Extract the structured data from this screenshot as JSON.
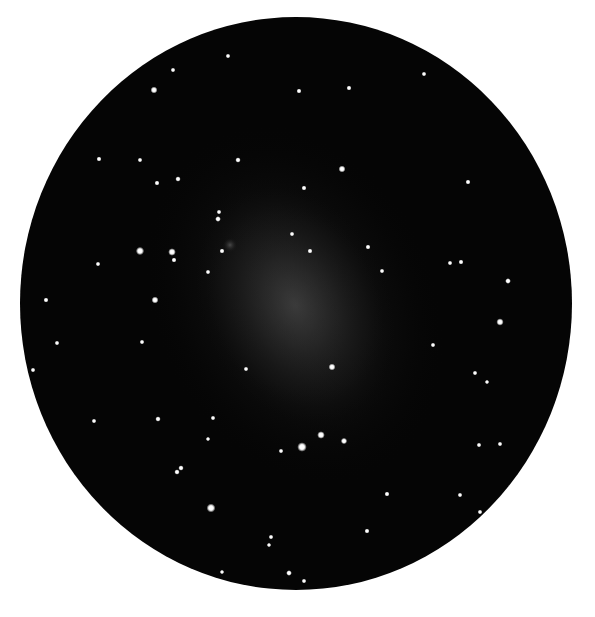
{
  "image": {
    "subject": "telescope eyepiece view of a faint galaxy with surrounding field stars",
    "background_color": "#ffffff",
    "field_color": "#050505"
  },
  "field_of_view": {
    "cx": 296,
    "cy": 303.5,
    "rx": 276,
    "ry": 286.5
  },
  "galaxy": {
    "cx": 295,
    "cy": 305,
    "rx": 95,
    "ry": 135,
    "rotation": -25,
    "core_color": "#3a3a3a",
    "halo_color": "#1a1a1a"
  },
  "nebulous_knot": {
    "x": 230,
    "y": 245,
    "r": 7
  },
  "stars": [
    {
      "x": 154,
      "y": 90,
      "r": 2.2
    },
    {
      "x": 173,
      "y": 70,
      "r": 1.5
    },
    {
      "x": 228,
      "y": 56,
      "r": 1.5
    },
    {
      "x": 299,
      "y": 91,
      "r": 1.6
    },
    {
      "x": 349,
      "y": 88,
      "r": 1.6
    },
    {
      "x": 424,
      "y": 74,
      "r": 1.5
    },
    {
      "x": 99,
      "y": 159,
      "r": 1.6
    },
    {
      "x": 140,
      "y": 160,
      "r": 1.5
    },
    {
      "x": 238,
      "y": 160,
      "r": 1.7
    },
    {
      "x": 157,
      "y": 183,
      "r": 1.6
    },
    {
      "x": 178,
      "y": 179,
      "r": 1.7
    },
    {
      "x": 342,
      "y": 169,
      "r": 2.2
    },
    {
      "x": 304,
      "y": 188,
      "r": 1.6
    },
    {
      "x": 468,
      "y": 182,
      "r": 1.6
    },
    {
      "x": 219,
      "y": 212,
      "r": 1.5
    },
    {
      "x": 218,
      "y": 219,
      "r": 1.8
    },
    {
      "x": 292,
      "y": 234,
      "r": 1.5
    },
    {
      "x": 140,
      "y": 251,
      "r": 2.6
    },
    {
      "x": 172,
      "y": 252,
      "r": 2.4
    },
    {
      "x": 174,
      "y": 260,
      "r": 1.6
    },
    {
      "x": 222,
      "y": 251,
      "r": 1.6
    },
    {
      "x": 310,
      "y": 251,
      "r": 1.6
    },
    {
      "x": 368,
      "y": 247,
      "r": 1.6
    },
    {
      "x": 98,
      "y": 264,
      "r": 1.5
    },
    {
      "x": 208,
      "y": 272,
      "r": 1.5
    },
    {
      "x": 382,
      "y": 271,
      "r": 1.5
    },
    {
      "x": 450,
      "y": 263,
      "r": 1.5
    },
    {
      "x": 461,
      "y": 262,
      "r": 1.6
    },
    {
      "x": 508,
      "y": 281,
      "r": 1.8
    },
    {
      "x": 46,
      "y": 300,
      "r": 1.6
    },
    {
      "x": 155,
      "y": 300,
      "r": 2.2
    },
    {
      "x": 500,
      "y": 322,
      "r": 2.3
    },
    {
      "x": 57,
      "y": 343,
      "r": 1.5
    },
    {
      "x": 142,
      "y": 342,
      "r": 1.5
    },
    {
      "x": 433,
      "y": 345,
      "r": 1.5
    },
    {
      "x": 246,
      "y": 369,
      "r": 1.5
    },
    {
      "x": 332,
      "y": 367,
      "r": 2.2
    },
    {
      "x": 33,
      "y": 370,
      "r": 1.5
    },
    {
      "x": 475,
      "y": 373,
      "r": 1.5
    },
    {
      "x": 487,
      "y": 382,
      "r": 1.4
    },
    {
      "x": 94,
      "y": 421,
      "r": 1.5
    },
    {
      "x": 158,
      "y": 419,
      "r": 1.7
    },
    {
      "x": 213,
      "y": 418,
      "r": 1.5
    },
    {
      "x": 208,
      "y": 439,
      "r": 1.4
    },
    {
      "x": 281,
      "y": 451,
      "r": 1.5
    },
    {
      "x": 302,
      "y": 447,
      "r": 3.0
    },
    {
      "x": 321,
      "y": 435,
      "r": 2.4
    },
    {
      "x": 344,
      "y": 441,
      "r": 2.0
    },
    {
      "x": 479,
      "y": 445,
      "r": 1.5
    },
    {
      "x": 500,
      "y": 444,
      "r": 1.5
    },
    {
      "x": 177,
      "y": 472,
      "r": 1.7
    },
    {
      "x": 181,
      "y": 468,
      "r": 1.7
    },
    {
      "x": 387,
      "y": 494,
      "r": 1.6
    },
    {
      "x": 460,
      "y": 495,
      "r": 1.5
    },
    {
      "x": 211,
      "y": 508,
      "r": 2.8
    },
    {
      "x": 480,
      "y": 512,
      "r": 1.5
    },
    {
      "x": 367,
      "y": 531,
      "r": 1.6
    },
    {
      "x": 271,
      "y": 537,
      "r": 1.5
    },
    {
      "x": 269,
      "y": 545,
      "r": 1.4
    },
    {
      "x": 222,
      "y": 572,
      "r": 1.4
    },
    {
      "x": 289,
      "y": 573,
      "r": 1.8
    },
    {
      "x": 304,
      "y": 581,
      "r": 1.5
    }
  ]
}
